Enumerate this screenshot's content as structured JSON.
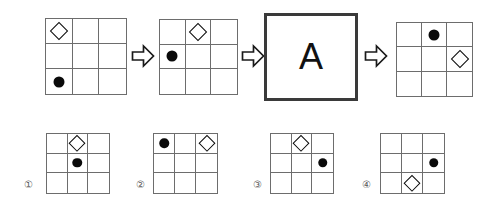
{
  "puzzle": {
    "type": "figure-sequence-analogy",
    "letter_box": {
      "letter": "A"
    },
    "arrow_icon": "right-arrow-icon",
    "grid": {
      "rows": 3,
      "cols": 3
    },
    "marks": {
      "circle": "●",
      "diamond": "◇"
    },
    "colors": {
      "grid_line": "#6d6d6d",
      "mark": "#0a0a0a",
      "letter_box_border": "#3a3a3a",
      "background": "#ffffff",
      "label": "#5a5a5a"
    },
    "sequence": [
      {
        "name": "figure-1",
        "cells": [
          "diamond",
          "empty",
          "empty",
          "empty",
          "empty",
          "empty",
          "circle",
          "empty",
          "empty"
        ]
      },
      {
        "name": "figure-2",
        "cells": [
          "empty",
          "diamond",
          "empty",
          "circle",
          "empty",
          "empty",
          "empty",
          "empty",
          "empty"
        ]
      },
      {
        "name": "figure-3",
        "cells": [
          "empty",
          "circle",
          "empty",
          "empty",
          "empty",
          "diamond",
          "empty",
          "empty",
          "empty"
        ]
      }
    ],
    "options": [
      {
        "label": "①",
        "name": "option-1",
        "cells": [
          "empty",
          "diamond",
          "empty",
          "empty",
          "circle",
          "empty",
          "empty",
          "empty",
          "empty"
        ]
      },
      {
        "label": "②",
        "name": "option-2",
        "cells": [
          "circle",
          "empty",
          "diamond",
          "empty",
          "empty",
          "empty",
          "empty",
          "empty",
          "empty"
        ]
      },
      {
        "label": "③",
        "name": "option-3",
        "cells": [
          "empty",
          "diamond",
          "empty",
          "empty",
          "empty",
          "circle",
          "empty",
          "empty",
          "empty"
        ]
      },
      {
        "label": "④",
        "name": "option-4",
        "cells": [
          "empty",
          "empty",
          "empty",
          "empty",
          "empty",
          "circle",
          "empty",
          "diamond",
          "empty"
        ]
      }
    ]
  }
}
